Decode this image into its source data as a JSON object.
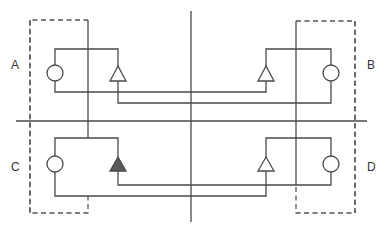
{
  "diagram": {
    "type": "quadrant-circuit-schematic",
    "quadrants": [
      {
        "id": "A",
        "label": "A",
        "position": "top-left",
        "triangle_filled": false
      },
      {
        "id": "B",
        "label": "B",
        "position": "top-right",
        "triangle_filled": false
      },
      {
        "id": "C",
        "label": "C",
        "position": "bottom-left",
        "triangle_filled": true
      },
      {
        "id": "D",
        "label": "D",
        "position": "bottom-right",
        "triangle_filled": false
      }
    ],
    "colors": {
      "line": "#4a4a4a",
      "filled_triangle": "#5a5a5a",
      "background": "#ffffff"
    }
  }
}
